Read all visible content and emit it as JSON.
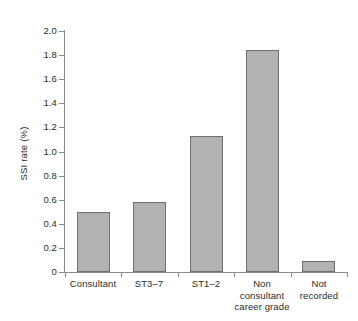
{
  "chart_data": {
    "type": "bar",
    "title": "",
    "xlabel": "",
    "ylabel": "SSI rate (%)",
    "categories": [
      "Consultant",
      "ST3–7",
      "ST1–2",
      "Non consultant career grade",
      "Not recorded"
    ],
    "category_lines": [
      [
        "Consultant"
      ],
      [
        "ST3–7"
      ],
      [
        "ST1–2"
      ],
      [
        "Non",
        "consultant",
        "career grade"
      ],
      [
        "Not",
        "recorded"
      ]
    ],
    "values": [
      0.5,
      0.58,
      1.13,
      1.84,
      0.09
    ],
    "ylim": [
      0,
      2.0
    ],
    "ytick_values": [
      0,
      0.2,
      0.4,
      0.6,
      0.8,
      1.0,
      1.2,
      1.4,
      1.6,
      1.8,
      2.0
    ],
    "ytick_labels": [
      "0",
      "0.2",
      "0.4",
      "0.6",
      "0.8",
      "1.0",
      "1.2",
      "1.4",
      "1.6",
      "1.8",
      "2.0"
    ],
    "grid": false,
    "legend": null,
    "bar_color": "#b2b2b2",
    "bar_border_color": "#6f6f6f",
    "axis_color": "#8a8a8a",
    "text_color": "#2b2b2b",
    "background": "#ffffff"
  }
}
